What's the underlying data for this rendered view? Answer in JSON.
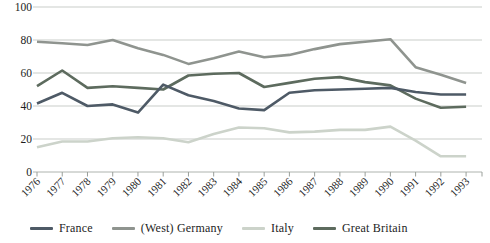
{
  "chart_data": {
    "type": "line",
    "title": "",
    "xlabel": "",
    "ylabel": "",
    "x": [
      1976,
      1977,
      1978,
      1979,
      1980,
      1981,
      1982,
      1983,
      1984,
      1985,
      1986,
      1987,
      1988,
      1989,
      1990,
      1991,
      1992,
      1993
    ],
    "yticks": [
      0,
      20,
      40,
      60,
      80,
      100
    ],
    "ylim": [
      0,
      100
    ],
    "grid": true,
    "legend_position": "bottom",
    "series": [
      {
        "name": "France",
        "color": "#4e5a66",
        "values": [
          41.5,
          48,
          40,
          41,
          36,
          53,
          46.5,
          43,
          38.5,
          37.5,
          48,
          49.5,
          50,
          50.5,
          51,
          48.5,
          47,
          47
        ]
      },
      {
        "name": "(West) Germany",
        "color": "#8f948f",
        "values": [
          79,
          78,
          77,
          80,
          75,
          71,
          65.5,
          69,
          73,
          69.5,
          71,
          74.5,
          77.5,
          79,
          80.5,
          63.5,
          59,
          54
        ]
      },
      {
        "name": "Italy",
        "color": "#ccd3ca",
        "values": [
          15,
          18.5,
          18.5,
          20.5,
          21,
          20.5,
          18,
          23,
          27,
          26.5,
          24,
          24.5,
          25.5,
          25.5,
          27.5,
          19,
          9.5,
          9.5
        ]
      },
      {
        "name": "Great Britain",
        "color": "#5d6b5e",
        "values": [
          52,
          61.5,
          51,
          52,
          51,
          50,
          58.5,
          59.5,
          60,
          51.5,
          54,
          56.5,
          57.5,
          54.5,
          52.5,
          44.5,
          39,
          39.5
        ]
      }
    ],
    "colors": {
      "gridline": "#c9cdc9",
      "axis_line": "#aeb3ae",
      "tick": "#9a9f9a",
      "label_text": "#1d1d1d"
    }
  }
}
